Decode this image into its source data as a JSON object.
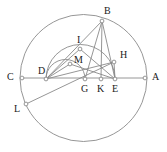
{
  "figure": {
    "type": "geometry-diagram",
    "title": "",
    "stroke_color": "#8a8a8a",
    "label_color": "#1a1a1a",
    "background": "#ffffff",
    "vertex_marker": "open-circle"
  },
  "points": [
    {
      "id": "A",
      "label": "A",
      "x": 145,
      "y": 78,
      "label_x": 152,
      "label_y": 72,
      "marker": true
    },
    {
      "id": "B",
      "label": "B",
      "x": 102,
      "y": 21,
      "label_x": 104,
      "label_y": 6,
      "marker": true
    },
    {
      "id": "C",
      "label": "C",
      "x": 22,
      "y": 78,
      "label_x": 7,
      "label_y": 72,
      "marker": true
    },
    {
      "id": "D",
      "label": "D",
      "x": 46,
      "y": 79,
      "label_x": 38,
      "label_y": 66,
      "marker": true
    },
    {
      "id": "E",
      "label": "E",
      "x": 115,
      "y": 79,
      "label_x": 112,
      "label_y": 84,
      "marker": true
    },
    {
      "id": "G",
      "label": "G",
      "x": 85,
      "y": 79,
      "label_x": 81,
      "label_y": 84,
      "marker": true
    },
    {
      "id": "H",
      "label": "H",
      "x": 114,
      "y": 62,
      "label_x": 120,
      "label_y": 50,
      "marker": true
    },
    {
      "id": "I",
      "label": "I",
      "x": 80,
      "y": 49,
      "label_x": 77,
      "label_y": 35,
      "marker": true
    },
    {
      "id": "K",
      "label": "K",
      "x": 101,
      "y": 79,
      "label_x": 97,
      "label_y": 84,
      "marker": true
    },
    {
      "id": "L",
      "label": "L",
      "x": 26,
      "y": 104,
      "label_x": 14,
      "label_y": 104,
      "marker": true
    },
    {
      "id": "M",
      "label": "M",
      "x": 70,
      "y": 64,
      "label_x": 74,
      "label_y": 55,
      "marker": true
    }
  ],
  "circles": [
    {
      "id": "main-circle",
      "cx": 83.5,
      "cy": 78,
      "r": 63.5
    }
  ],
  "arcs": [
    {
      "id": "arc-D-I-E",
      "cx": 80.5,
      "cy": 79,
      "r": 34.5,
      "start_deg": 180,
      "end_deg": 0,
      "note": "semicircle on diameter DE through I"
    },
    {
      "id": "arc-D-M-G",
      "cx": 65.5,
      "cy": 79,
      "r": 19.5,
      "start_deg": 180,
      "end_deg": 0,
      "note": "semicircle on diameter DG through M"
    }
  ],
  "segments": [
    {
      "id": "CA",
      "from": "C",
      "to": "A"
    },
    {
      "id": "BD",
      "from": "B",
      "to": "D"
    },
    {
      "id": "BK",
      "from": "B",
      "to": "K"
    },
    {
      "id": "BE",
      "from": "B",
      "to": "E"
    },
    {
      "id": "BG",
      "from": "B",
      "to": "G"
    },
    {
      "id": "DH",
      "from": "D",
      "to": "H"
    },
    {
      "id": "DI",
      "from": "D",
      "to": "I"
    },
    {
      "id": "DM",
      "from": "D",
      "to": "M"
    },
    {
      "id": "IE",
      "from": "I",
      "to": "E"
    },
    {
      "id": "ME",
      "from": "M",
      "to": "E"
    },
    {
      "id": "HE",
      "from": "H",
      "to": "E"
    },
    {
      "id": "LH",
      "from": "L",
      "to": "H"
    }
  ],
  "labels_order": [
    "B",
    "I",
    "H",
    "M",
    "C",
    "D",
    "A",
    "G",
    "K",
    "E",
    "L"
  ]
}
